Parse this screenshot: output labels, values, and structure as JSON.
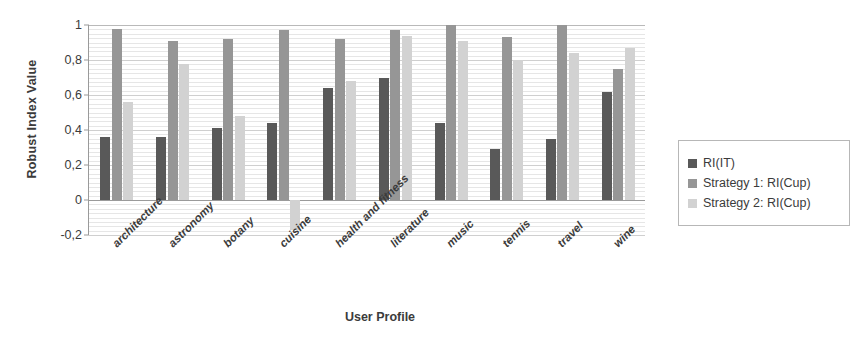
{
  "chart_data": {
    "type": "bar",
    "title": "",
    "xlabel": "User Profile",
    "ylabel": "Robust Index Value",
    "ylim": [
      -0.2,
      1.0
    ],
    "ytick_labels": [
      "1",
      "0,8",
      "0,6",
      "0,4",
      "0,2",
      "0",
      "-0,2"
    ],
    "ytick_values": [
      1,
      0.8,
      0.6,
      0.4,
      0.2,
      0,
      -0.2
    ],
    "grid": true,
    "legend_position": "right",
    "decimal_separator": ",",
    "categories": [
      "architecture",
      "astronomy",
      "botany",
      "cuisine",
      "health and fitness",
      "literature",
      "music",
      "tennis",
      "travel",
      "wine"
    ],
    "series": [
      {
        "name": "RI(IT)",
        "color": "#595959",
        "values": [
          0.36,
          0.36,
          0.41,
          0.44,
          0.64,
          0.7,
          0.44,
          0.29,
          0.35,
          0.62
        ]
      },
      {
        "name": "Strategy 1: RI(Cup)",
        "color": "#969696",
        "values": [
          0.98,
          0.91,
          0.92,
          0.97,
          0.92,
          0.97,
          1.0,
          0.93,
          1.0,
          0.75
        ]
      },
      {
        "name": "Strategy 2: RI(Cup)",
        "color": "#d2d2d2",
        "values": [
          0.56,
          0.78,
          0.48,
          -0.17,
          0.68,
          0.94,
          0.91,
          0.8,
          0.84,
          0.87
        ]
      }
    ]
  },
  "legend": {
    "items": [
      {
        "label": "RI(IT)"
      },
      {
        "label": "Strategy 1: RI(Cup)"
      },
      {
        "label": "Strategy 2: RI(Cup)"
      }
    ]
  }
}
